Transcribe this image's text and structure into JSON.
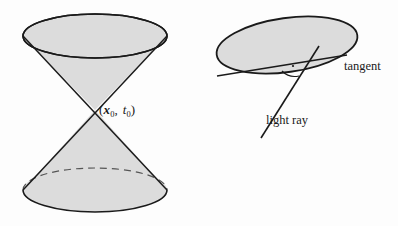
{
  "figure": {
    "kind": "geometry-diagram",
    "background_color": "#fdfdfd",
    "stroke_color": "#1a1a1a",
    "surface_fill_color": "#dcdcdc",
    "panels": [
      {
        "name": "light-cone",
        "description": "Double light cone (past and future) meeting at an event"
      },
      {
        "name": "tangent-light-ray",
        "description": "Tilted cone cross-section with tangent line and light ray"
      }
    ]
  },
  "labels": {
    "apex": {
      "open_paren": "(",
      "vector_symbol": "x",
      "vector_subscript": "0",
      "comma": ",",
      "scalar_symbol": "t",
      "scalar_subscript": "0",
      "close_paren": ")",
      "plain_text": "(x0, t0)"
    },
    "tangent": "tangent",
    "light_ray": "light ray"
  },
  "geometry": {
    "cone": {
      "top_ellipse": {
        "cx": 95,
        "cy": 36,
        "rx": 72,
        "ry": 22,
        "stroke": "solid"
      },
      "bottom_ellipse": {
        "cx": 95,
        "cy": 190,
        "rx": 72,
        "ry": 22,
        "stroke_front": "solid",
        "stroke_back": "dashed"
      },
      "apex": {
        "x": 95,
        "y": 110
      }
    },
    "right_panel": {
      "ellipse": {
        "cx": 287,
        "cy": 45,
        "rx": 71,
        "ry": 27,
        "rotation_deg": -8
      },
      "tangent_line": {
        "x1": 217,
        "y1": 76,
        "x2": 347,
        "y2": 55
      },
      "light_ray_line": {
        "x1": 319,
        "y1": 46,
        "x2": 261,
        "y2": 138
      },
      "angle_marker": {
        "cx": 297,
        "cy": 66,
        "has_dot": true
      }
    }
  }
}
